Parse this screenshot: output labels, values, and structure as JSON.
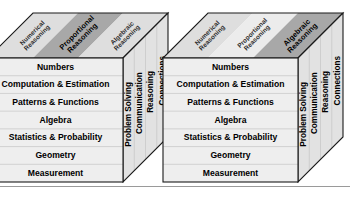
{
  "figure": {
    "front_face_rows": [
      "Numbers",
      "Computation & Estimation",
      "Patterns & Functions",
      "Algebra",
      "Statistics & Probability",
      "Geometry",
      "Measurement"
    ],
    "side_face_labels": [
      "Problem Solving",
      "Communication",
      "Reasoning",
      "Connections"
    ],
    "top_face_bands": [
      "Numerical Reasoning",
      "Proportional Reasoning",
      "Algebraic Reasoning"
    ],
    "colors": {
      "outline": "#1a1a1a",
      "front_face": "#eeeeee",
      "side_face": "#e2e2e2",
      "band_light": "#ececec",
      "band_medium": "#dedede",
      "band_highlight": "#a8a8a8",
      "rule": "#9a9a9a"
    }
  },
  "cubes": [
    {
      "name": "left-cube",
      "highlighted_band": "Proportional Reasoning",
      "highlighted_index": 1,
      "top_bands": [
        {
          "label": "Numerical Reasoning",
          "highlighted": false
        },
        {
          "label": "Proportional Reasoning",
          "highlighted": true
        },
        {
          "label": "Algebraic Reasoning",
          "highlighted": false
        }
      ],
      "front_rows": [
        "Numbers",
        "Computation & Estimation",
        "Patterns & Functions",
        "Algebra",
        "Statistics & Probability",
        "Geometry",
        "Measurement"
      ],
      "side_labels": [
        "Problem Solving",
        "Communication",
        "Reasoning",
        "Connections"
      ]
    },
    {
      "name": "right-cube",
      "highlighted_band": "Algebraic Reasoning",
      "highlighted_index": 2,
      "top_bands": [
        {
          "label": "Numerical Reasoning",
          "highlighted": false
        },
        {
          "label": "Proportional Reasoning",
          "highlighted": false
        },
        {
          "label": "Algebraic Reasoning",
          "highlighted": true
        }
      ],
      "front_rows": [
        "Numbers",
        "Computation & Estimation",
        "Patterns & Functions",
        "Algebra",
        "Statistics & Probability",
        "Geometry",
        "Measurement"
      ],
      "side_labels": [
        "Problem Solving",
        "Communication",
        "Reasoning",
        "Connections"
      ]
    }
  ]
}
